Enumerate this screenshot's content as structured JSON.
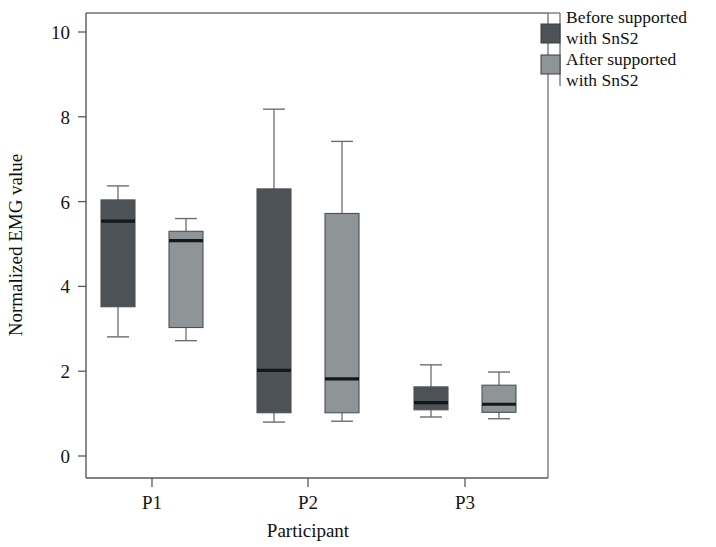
{
  "chart_data": {
    "type": "box",
    "title": "",
    "xlabel": "Participant",
    "ylabel": "Normalized EMG value",
    "categories": [
      "P1",
      "P2",
      "P3"
    ],
    "ylim": [
      0,
      10.6
    ],
    "yticks": [
      0,
      2,
      4,
      6,
      8,
      10
    ],
    "ytick_labels": [
      "0",
      "2",
      "4",
      "6",
      "8",
      "10"
    ],
    "grid": false,
    "legend_position": "top-right",
    "series": [
      {
        "name": "Before supported with SnS2",
        "color": "#4d5256",
        "boxes": [
          {
            "category": "P1",
            "whisker_low": 2.81,
            "q1": 3.52,
            "median": 5.54,
            "q3": 6.04,
            "whisker_high": 6.37
          },
          {
            "category": "P2",
            "whisker_low": 0.8,
            "q1": 1.02,
            "median": 2.02,
            "q3": 6.3,
            "whisker_high": 8.18
          },
          {
            "category": "P3",
            "whisker_low": 0.92,
            "q1": 1.09,
            "median": 1.26,
            "q3": 1.63,
            "whisker_high": 2.15
          }
        ]
      },
      {
        "name": "After supported with SnS2",
        "color": "#8f9497",
        "boxes": [
          {
            "category": "P1",
            "whisker_low": 2.72,
            "q1": 3.03,
            "median": 5.08,
            "q3": 5.3,
            "whisker_high": 5.6
          },
          {
            "category": "P2",
            "whisker_low": 0.82,
            "q1": 1.02,
            "median": 1.82,
            "q3": 5.72,
            "whisker_high": 7.42
          },
          {
            "category": "P3",
            "whisker_low": 0.88,
            "q1": 1.03,
            "median": 1.22,
            "q3": 1.67,
            "whisker_high": 1.98
          }
        ]
      }
    ]
  },
  "legend": {
    "entries": [
      {
        "line1": "Before supported",
        "line2": "with SnS2",
        "color": "#4d5256"
      },
      {
        "line1": "After supported",
        "line2": "with SnS2",
        "color": "#8f9497"
      }
    ]
  },
  "axes": {
    "y_title": "Normalized EMG value",
    "x_title": "Participant",
    "y_tick_0": "0",
    "y_tick_1": "2",
    "y_tick_2": "4",
    "y_tick_3": "6",
    "y_tick_4": "8",
    "y_tick_5": "10",
    "x_tick_0": "P1",
    "x_tick_1": "P2",
    "x_tick_2": "P3"
  }
}
